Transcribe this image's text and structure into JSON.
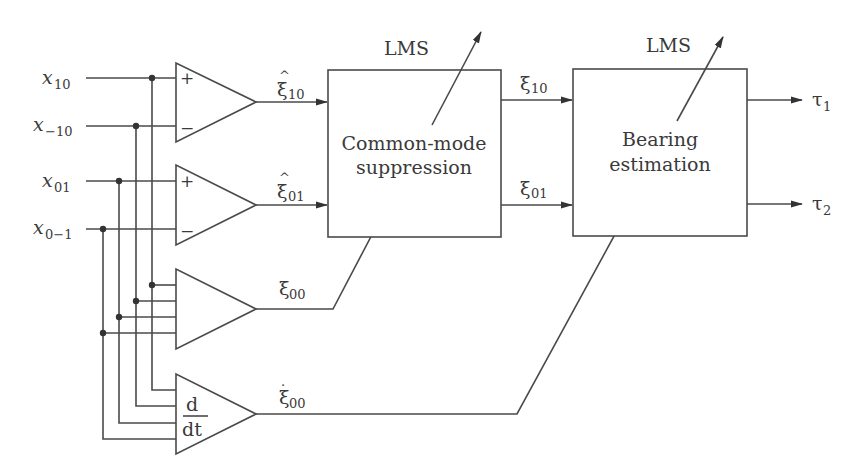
{
  "diagram": {
    "inputs": [
      {
        "symbol": "x",
        "subscript": "10"
      },
      {
        "symbol": "x",
        "subscript": "−10"
      },
      {
        "symbol": "x",
        "subscript": "01"
      },
      {
        "symbol": "x",
        "subscript": "0−1"
      }
    ],
    "amplifiers": [
      {
        "name": "diff-amp-10",
        "plus": "+",
        "minus": "−",
        "output_symbol": "ξ",
        "output_accent": "^",
        "output_subscript": "10"
      },
      {
        "name": "diff-amp-01",
        "plus": "+",
        "minus": "−",
        "output_symbol": "ξ",
        "output_accent": "^",
        "output_subscript": "01"
      },
      {
        "name": "sum-amp-00",
        "output_symbol": "ξ",
        "output_subscript": "00"
      },
      {
        "name": "derivative-amp-00",
        "label_num": "d",
        "label_den": "dt",
        "output_symbol": "ξ",
        "output_accent": "·",
        "output_subscript": "00"
      }
    ],
    "blocks": [
      {
        "name": "common-mode-suppression",
        "line1": "Common-mode",
        "line2": "suppression",
        "adapt_label": "LMS",
        "outputs": [
          {
            "symbol": "ξ",
            "subscript": "10"
          },
          {
            "symbol": "ξ",
            "subscript": "01"
          }
        ]
      },
      {
        "name": "bearing-estimation",
        "line1": "Bearing",
        "line2": "estimation",
        "adapt_label": "LMS",
        "outputs": [
          {
            "symbol": "τ",
            "subscript": "1"
          },
          {
            "symbol": "τ",
            "subscript": "2"
          }
        ]
      }
    ],
    "colors": {
      "line": "#4a4a4a",
      "text": "#3a3a3a",
      "background": "#ffffff"
    }
  }
}
